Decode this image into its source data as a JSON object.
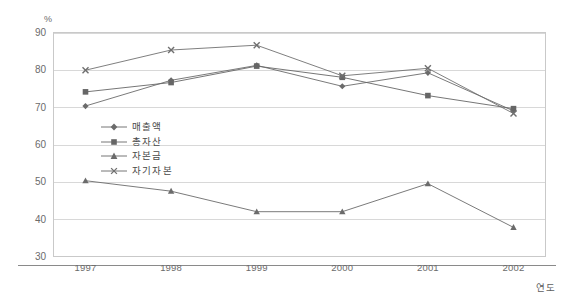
{
  "chart_data": {
    "type": "line",
    "title": "",
    "xlabel": "연도",
    "ylabel": "%",
    "categories": [
      "1997",
      "1998",
      "1999",
      "2000",
      "2001",
      "2002"
    ],
    "ylim": [
      30,
      90
    ],
    "yticks": [
      30,
      40,
      50,
      60,
      70,
      80,
      90
    ],
    "grid": true,
    "legend_position": "inside-left",
    "series": [
      {
        "name": "매출액",
        "marker": "diamond",
        "color": "#6b6b6b",
        "values": [
          70.3,
          77.2,
          81.2,
          75.6,
          79.2,
          69.0
        ]
      },
      {
        "name": "총자산",
        "marker": "square",
        "color": "#666666",
        "values": [
          74.1,
          76.6,
          81.0,
          78.0,
          73.1,
          69.6
        ]
      },
      {
        "name": "자본금",
        "marker": "triangle",
        "color": "#6b6b6b",
        "values": [
          50.3,
          47.5,
          42.0,
          42.0,
          49.5,
          37.8
        ]
      },
      {
        "name": "자기자본",
        "marker": "x",
        "color": "#707070",
        "values": [
          79.9,
          85.3,
          86.6,
          78.4,
          80.4,
          68.3
        ]
      }
    ]
  },
  "axis": {
    "y_unit_label": "%",
    "x_title": "연도",
    "ytick_labels": [
      "90",
      "80",
      "70",
      "60",
      "50",
      "40",
      "30"
    ],
    "xtick_labels": [
      "1997",
      "1998",
      "1999",
      "2000",
      "2001",
      "2002"
    ]
  },
  "legend": {
    "items": [
      {
        "label": "매출액",
        "marker": "diamond"
      },
      {
        "label": "총자산",
        "marker": "square"
      },
      {
        "label": "자본금",
        "marker": "triangle"
      },
      {
        "label": "자기자본",
        "marker": "x"
      }
    ]
  },
  "colors": {
    "line": "#777777",
    "grid": "#d8d8d8",
    "frame": "#c9c9c9",
    "text": "#6b6b6b"
  }
}
